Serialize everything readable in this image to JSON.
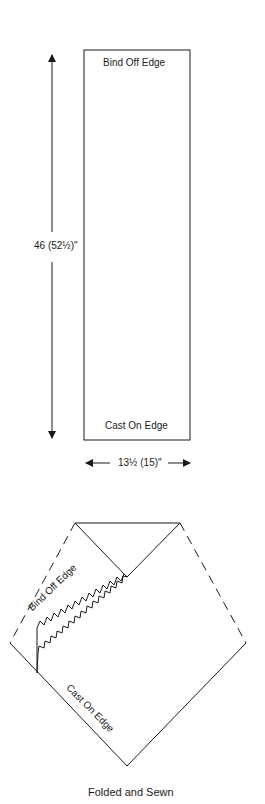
{
  "pattern_schematic": {
    "top_label": "Bind Off Edge",
    "bottom_label": "Cast On Edge",
    "length_dimension": "46 (52½)\"",
    "width_dimension": "13½ (15)\""
  },
  "folded_diagram": {
    "bind_off_label": "Bind Off Edge",
    "cast_on_label": "Cast On Edge",
    "caption": "Folded and Sewn"
  },
  "colors": {
    "line": "#1a1a1a",
    "background": "#ffffff"
  }
}
